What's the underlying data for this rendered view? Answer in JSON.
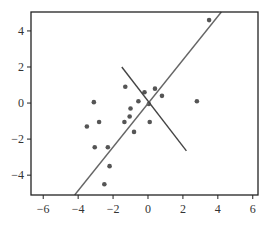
{
  "chart_data": {
    "type": "scatter",
    "title": "",
    "xlabel": "",
    "ylabel": "",
    "xlim": [
      -6.7,
      6.3
    ],
    "ylim": [
      -5.1,
      5.05
    ],
    "grid": false,
    "legend": null,
    "x_ticks": [
      -6,
      -4,
      -2,
      0,
      2,
      4,
      6
    ],
    "x_tick_labels": [
      "−6",
      "−4",
      "−2",
      "0",
      "2",
      "4",
      "6"
    ],
    "y_ticks": [
      4,
      2,
      0,
      -2,
      -4
    ],
    "y_tick_labels": [
      "4",
      "2",
      "0",
      "−2",
      "−4"
    ],
    "series": [
      {
        "name": "points",
        "kind": "scatter",
        "color": "#555555",
        "points": [
          [
            -3.1,
            0.05
          ],
          [
            -3.5,
            -1.3
          ],
          [
            -2.8,
            -1.05
          ],
          [
            -1.3,
            0.9
          ],
          [
            -0.2,
            0.6
          ],
          [
            0.4,
            0.8
          ],
          [
            0.8,
            0.4
          ],
          [
            -0.55,
            0.1
          ],
          [
            0.05,
            -0.05
          ],
          [
            -1.0,
            -0.3
          ],
          [
            -1.35,
            -1.05
          ],
          [
            -1.05,
            -0.75
          ],
          [
            0.1,
            -1.05
          ],
          [
            -0.8,
            -1.6
          ],
          [
            -3.05,
            -2.45
          ],
          [
            -2.3,
            -2.45
          ],
          [
            -2.2,
            -3.5
          ],
          [
            -2.5,
            -4.5
          ],
          [
            2.8,
            0.1
          ],
          [
            3.5,
            4.6
          ]
        ]
      },
      {
        "name": "principal axis",
        "kind": "line",
        "color": "#666666",
        "points": [
          [
            -4.2,
            -5.1
          ],
          [
            4.2,
            5.05
          ]
        ]
      },
      {
        "name": "perpendicular axis",
        "kind": "line",
        "color": "#444444",
        "points": [
          [
            -1.5,
            2.0
          ],
          [
            2.2,
            -2.65
          ]
        ]
      }
    ]
  },
  "layout": {
    "plot_left": 31,
    "plot_top": 12,
    "plot_right": 258,
    "plot_bottom": 195
  }
}
